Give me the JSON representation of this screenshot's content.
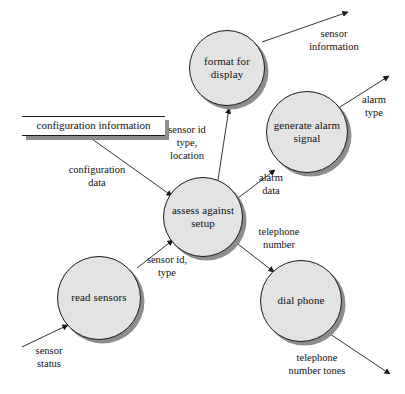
{
  "diagram": {
    "type": "data-flow-diagram",
    "background_color": "#ffffff",
    "node_fill_color": "#e3e3e3",
    "node_border_color": "#1b1b1b",
    "shadow_color": "#8d8d8d",
    "text_color": "#111111"
  },
  "processes": [
    {
      "id": "format-for-display",
      "label": "format\nfor\ndisplay",
      "cx": 227,
      "cy": 68,
      "r": 38
    },
    {
      "id": "generate-alarm-signal",
      "label": "generate\nalarm\nsignal",
      "cx": 307,
      "cy": 132,
      "r": 41
    },
    {
      "id": "assess-against-setup",
      "label": "assess\nagainst\nsetup",
      "cx": 203,
      "cy": 217,
      "r": 40
    },
    {
      "id": "read-sensors",
      "label": "read\nsensors",
      "cx": 99,
      "cy": 298,
      "r": 42
    },
    {
      "id": "dial-phone",
      "label": "dial\nphone",
      "cx": 301,
      "cy": 301,
      "r": 41
    }
  ],
  "data_stores": [
    {
      "id": "configuration-information",
      "label": "configuration information"
    }
  ],
  "flows": [
    {
      "id": "sensor-information",
      "label": "sensor\ninformation",
      "from": "format-for-display",
      "to": "external-sink"
    },
    {
      "id": "alarm-type",
      "label": "alarm\ntype",
      "from": "generate-alarm-signal",
      "to": "external-sink"
    },
    {
      "id": "sensor-id-type-location",
      "label": "sensor id\ntype,\nlocation",
      "from": "assess-against-setup",
      "to": "format-for-display"
    },
    {
      "id": "configuration-data",
      "label": "configuration\ndata",
      "from": "configuration-information",
      "to": "assess-against-setup"
    },
    {
      "id": "alarm-data",
      "label": "alarm\ndata",
      "from": "assess-against-setup",
      "to": "generate-alarm-signal"
    },
    {
      "id": "telephone-number",
      "label": "telephone\nnumber",
      "from": "assess-against-setup",
      "to": "dial-phone"
    },
    {
      "id": "sensor-id-type",
      "label": "sensor id,\ntype",
      "from": "read-sensors",
      "to": "assess-against-setup"
    },
    {
      "id": "sensor-status",
      "label": "sensor\nstatus",
      "from": "external-source",
      "to": "read-sensors"
    },
    {
      "id": "telephone-number-tones",
      "label": "telephone\nnumber tones",
      "from": "dial-phone",
      "to": "external-sink"
    }
  ]
}
